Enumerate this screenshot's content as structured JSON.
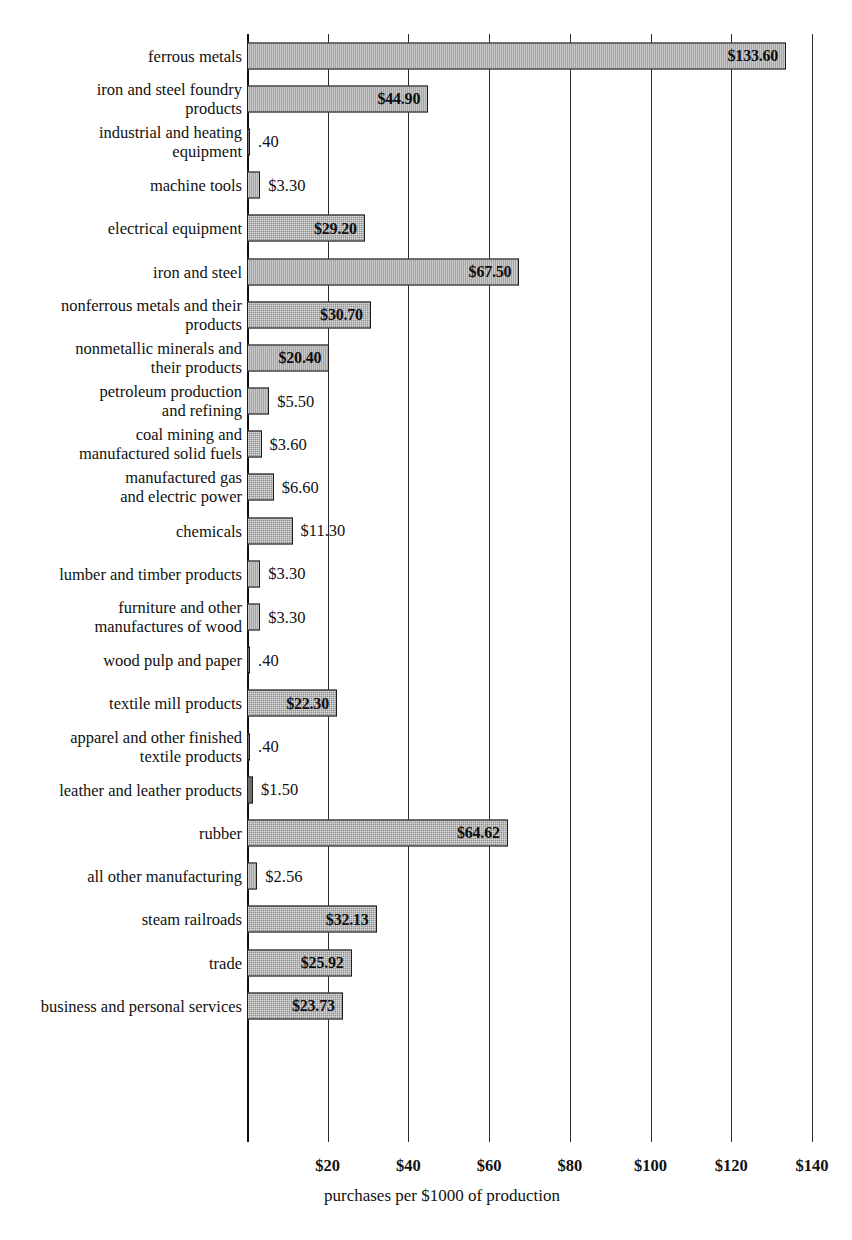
{
  "chart_data": {
    "type": "bar",
    "orientation": "horizontal",
    "title": "",
    "xlabel": "purchases per $1000 of production",
    "ylabel": "",
    "xlim": [
      0,
      140
    ],
    "grid": true,
    "legend": "none",
    "xticks": [
      {
        "value": 20,
        "label": "$20"
      },
      {
        "value": 40,
        "label": "$40"
      },
      {
        "value": 60,
        "label": "$60"
      },
      {
        "value": 80,
        "label": "$80"
      },
      {
        "value": 100,
        "label": "$100"
      },
      {
        "value": 120,
        "label": "$120"
      },
      {
        "value": 140,
        "label": "$140"
      }
    ],
    "categories": [
      "ferrous metals",
      "iron and steel foundry products",
      "industrial and heating equipment",
      "machine tools",
      "electrical equipment",
      "iron and steel",
      "nonferrous metals and their products",
      "nonmetallic minerals and their products",
      "petroleum production and refining",
      "coal mining and manufactured solid fuels",
      "manufactured gas and electric power",
      "chemicals",
      "lumber and timber products",
      "furniture and other manufactures of wood",
      "wood pulp and paper",
      "textile mill products",
      "apparel and other finished textile products",
      "leather and leather products",
      "rubber",
      "all other manufacturing",
      "steam railroads",
      "trade",
      "business and personal services"
    ],
    "values": [
      133.6,
      44.9,
      0.4,
      3.3,
      29.2,
      67.5,
      30.7,
      20.4,
      5.5,
      3.6,
      6.6,
      11.3,
      3.3,
      3.3,
      0.4,
      22.3,
      0.4,
      1.5,
      64.62,
      2.56,
      32.13,
      25.92,
      23.73
    ],
    "value_labels": [
      "$133.60",
      "$44.90",
      ".40",
      "$3.30",
      "$29.20",
      "$67.50",
      "$30.70",
      "$20.40",
      "$5.50",
      "$3.60",
      "$6.60",
      "$11.30",
      "$3.30",
      "$3.30",
      ".40",
      "$22.30",
      ".40",
      "$1.50",
      "$64.62",
      "$2.56",
      "$32.13",
      "$25.92",
      "$23.73"
    ]
  },
  "rows": [
    {
      "label": "ferrous metals",
      "value": 133.6,
      "value_label": "$133.60",
      "inside": true
    },
    {
      "label": "iron and steel foundry\nproducts",
      "value": 44.9,
      "value_label": "$44.90",
      "inside": true
    },
    {
      "label": "industrial and heating\nequipment",
      "value": 0.4,
      "value_label": ".40",
      "inside": false
    },
    {
      "label": "machine tools",
      "value": 3.3,
      "value_label": "$3.30",
      "inside": false
    },
    {
      "label": "electrical equipment",
      "value": 29.2,
      "value_label": "$29.20",
      "inside": true
    },
    {
      "label": "iron and steel",
      "value": 67.5,
      "value_label": "$67.50",
      "inside": true
    },
    {
      "label": "nonferrous metals and their\nproducts",
      "value": 30.7,
      "value_label": "$30.70",
      "inside": true
    },
    {
      "label": "nonmetallic minerals and\ntheir products",
      "value": 20.4,
      "value_label": "$20.40",
      "inside": true
    },
    {
      "label": "petroleum production\nand refining",
      "value": 5.5,
      "value_label": "$5.50",
      "inside": false
    },
    {
      "label": "coal mining and\nmanufactured solid fuels",
      "value": 3.6,
      "value_label": "$3.60",
      "inside": false
    },
    {
      "label": "manufactured gas\nand electric power",
      "value": 6.6,
      "value_label": "$6.60",
      "inside": false
    },
    {
      "label": "chemicals",
      "value": 11.3,
      "value_label": "$11.30",
      "inside": false
    },
    {
      "label": "lumber and timber products",
      "value": 3.3,
      "value_label": "$3.30",
      "inside": false
    },
    {
      "label": "furniture and other\nmanufactures of wood",
      "value": 3.3,
      "value_label": "$3.30",
      "inside": false
    },
    {
      "label": "wood pulp and paper",
      "value": 0.4,
      "value_label": ".40",
      "inside": false
    },
    {
      "label": "textile mill products",
      "value": 22.3,
      "value_label": "$22.30",
      "inside": true
    },
    {
      "label": "apparel and other finished\ntextile products",
      "value": 0.4,
      "value_label": ".40",
      "inside": false
    },
    {
      "label": "leather and leather products",
      "value": 1.5,
      "value_label": "$1.50",
      "inside": false
    },
    {
      "label": "rubber",
      "value": 64.62,
      "value_label": "$64.62",
      "inside": true
    },
    {
      "label": "all other manufacturing",
      "value": 2.56,
      "value_label": "$2.56",
      "inside": false
    },
    {
      "label": "steam railroads",
      "value": 32.13,
      "value_label": "$32.13",
      "inside": true
    },
    {
      "label": "trade",
      "value": 25.92,
      "value_label": "$25.92",
      "inside": true
    },
    {
      "label": "business and personal services",
      "value": 23.73,
      "value_label": "$23.73",
      "inside": true
    }
  ],
  "axis": {
    "title": "purchases per $1000 of production",
    "ticks": [
      "$20",
      "$40",
      "$60",
      "$80",
      "$100",
      "$120",
      "$140"
    ]
  },
  "colors": {
    "bar_fill": "#8e8e8e",
    "bar_border": "#1c1c1c",
    "grid": "#2b2b2b",
    "text": "#111111",
    "background": "#ffffff"
  }
}
